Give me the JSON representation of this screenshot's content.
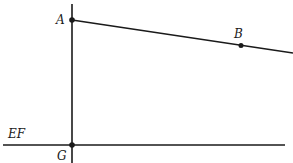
{
  "diagram": {
    "labels": {
      "A": "A",
      "B": "B",
      "EF": "EF",
      "G": "G"
    },
    "colors": {
      "stroke": "#1a1a1a",
      "background": "#ffffff"
    }
  }
}
